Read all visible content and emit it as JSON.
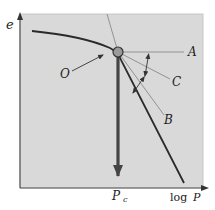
{
  "figure": {
    "type": "casagrande-construction",
    "axes": {
      "y_label": "e",
      "x_label_prefix": "log",
      "x_label_var": "P"
    },
    "labels": {
      "point_o": "O",
      "line_a": "A",
      "line_b": "B",
      "line_c": "C",
      "pc_main": "P",
      "pc_sub": "c"
    },
    "colors": {
      "background": "#d9d9d9",
      "curve": "#2a2a2a",
      "construction_line": "#8a8a8a",
      "pc_arrow": "#555555",
      "point_fill": "#9a9a9a"
    }
  }
}
